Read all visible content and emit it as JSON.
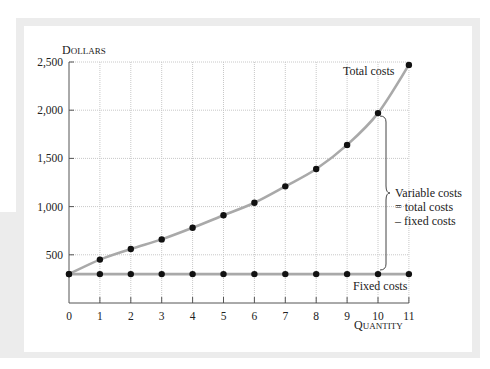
{
  "chart_data": {
    "type": "line",
    "title": "",
    "xlabel": "Quantity",
    "ylabel": "Dollars",
    "x": [
      0,
      1,
      2,
      3,
      4,
      5,
      6,
      7,
      8,
      9,
      10,
      11
    ],
    "series": [
      {
        "name": "Total costs",
        "values": [
          300,
          450,
          560,
          660,
          780,
          910,
          1040,
          1210,
          1390,
          1640,
          1970,
          2470
        ]
      },
      {
        "name": "Fixed costs",
        "values": [
          300,
          300,
          300,
          300,
          300,
          300,
          300,
          300,
          300,
          300,
          300,
          300
        ]
      }
    ],
    "xlim": [
      0,
      11
    ],
    "ylim": [
      0,
      2500
    ],
    "x_ticks": [
      "0",
      "1",
      "2",
      "3",
      "4",
      "5",
      "6",
      "7",
      "8",
      "9",
      "10",
      "11"
    ],
    "y_ticks": [
      {
        "value": 500,
        "label": "500"
      },
      {
        "value": 1000,
        "label": "1,000"
      },
      {
        "value": 1500,
        "label": "1,500"
      },
      {
        "value": 2000,
        "label": "2,000"
      },
      {
        "value": 2500,
        "label": "2,500"
      }
    ],
    "grid": true,
    "legend": "none (inline labels)",
    "annotations": [
      {
        "text": "Total costs",
        "near_x": 10,
        "near_y": 2300
      },
      {
        "text": "Fixed costs",
        "near_x": 10,
        "near_y": 150
      },
      {
        "text": "Variable costs",
        "line": 1
      },
      {
        "text": "= total costs",
        "line": 2
      },
      {
        "text": "– fixed costs",
        "line": 3
      }
    ],
    "brace": {
      "at_x": 10,
      "from": 300,
      "to": 1970
    }
  },
  "labels": {
    "y_axis_title_cap": "D",
    "y_axis_title_rest": "OLLARS",
    "x_axis_title_cap": "Q",
    "x_axis_title_rest": "UANTITY",
    "total_costs": "Total costs",
    "fixed_costs": "Fixed costs",
    "variable_line1": "Variable costs",
    "variable_line2": "= total costs",
    "variable_line3": "– fixed costs"
  },
  "colors": {
    "curve": "#a9a9a9",
    "point": "#111111",
    "grid": "#c8c8c8",
    "axis": "#555555",
    "frame": "#ececec"
  }
}
